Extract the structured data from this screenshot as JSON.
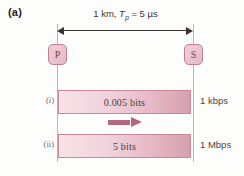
{
  "figure": {
    "caption": "(a)",
    "dimension": {
      "distance": "1 km,",
      "symbol": "T",
      "subscript": "p",
      "equals": "= 5 µs",
      "full_text": "1 km, Tp = 5 µs"
    },
    "nodes": [
      {
        "id": "P",
        "label": "P",
        "name": "node-p"
      },
      {
        "id": "S",
        "label": "S",
        "name": "node-s"
      }
    ],
    "rows": [
      {
        "tag": "(i)",
        "bar_label": "0.005 bits",
        "rate": "1 kbps"
      },
      {
        "tag": "(ii)",
        "bar_label": "5 bits",
        "rate": "1 Mbps"
      }
    ],
    "flow_arrow": {
      "direction": "right",
      "name": "flow-direction-arrow"
    },
    "colors": {
      "bar_border": "#c9879a",
      "bar_fill_light": "#f7e3e8",
      "bar_fill_dark": "#d69fae",
      "node_fill": "#e6b9c6",
      "node_border": "#c27f93",
      "arrow": "#b4687f",
      "rail": "#b9b7b4",
      "text": "#231f20",
      "background": "#fdfdfc"
    }
  }
}
